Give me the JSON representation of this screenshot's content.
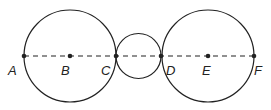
{
  "diagram": {
    "stroke_color": "#222222",
    "circles": [
      {
        "name": "left-circle",
        "cx": 70,
        "cy": 56,
        "r": 46
      },
      {
        "name": "middle-circle",
        "cx": 138.5,
        "cy": 56,
        "r": 22.5
      },
      {
        "name": "right-circle",
        "cx": 208,
        "cy": 56,
        "r": 46
      }
    ],
    "line": {
      "x1": 24,
      "y1": 56,
      "x2": 254,
      "y2": 56,
      "style": "dashed"
    },
    "points": [
      {
        "label": "A",
        "x": 24,
        "y": 56,
        "lx": 8,
        "ly": 75
      },
      {
        "label": "B",
        "x": 70,
        "y": 56,
        "lx": 61,
        "ly": 75
      },
      {
        "label": "C",
        "x": 116,
        "y": 56,
        "lx": 101,
        "ly": 75
      },
      {
        "label": "D",
        "x": 161,
        "y": 56,
        "lx": 166,
        "ly": 75
      },
      {
        "label": "E",
        "x": 208,
        "y": 56,
        "lx": 202,
        "ly": 75
      },
      {
        "label": "F",
        "x": 254,
        "y": 56,
        "lx": 254,
        "ly": 75
      }
    ]
  }
}
